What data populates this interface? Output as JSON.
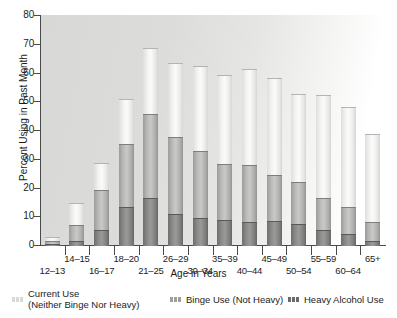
{
  "chart_data": {
    "type": "bar",
    "stacked": true,
    "title": "",
    "xlabel": "Age in Years",
    "ylabel": "Percent Using in Past Month",
    "ylim": [
      0,
      80
    ],
    "yticks": [
      0,
      10,
      20,
      30,
      40,
      50,
      60,
      70,
      80
    ],
    "grid": false,
    "legend_position": "bottom",
    "categories": [
      "12–13",
      "14–15",
      "16–17",
      "18–20",
      "21–25",
      "26–29",
      "30–34",
      "35–39",
      "40–44",
      "45–49",
      "50–54",
      "55–59",
      "60–64",
      "65+"
    ],
    "series": [
      {
        "name": "Heavy Alcohol Use",
        "color": "#7f7f7d",
        "values": [
          0.5,
          1.5,
          5.5,
          13.5,
          16.5,
          11.0,
          9.5,
          9.0,
          8.0,
          8.5,
          7.5,
          5.5,
          4.0,
          1.5
        ]
      },
      {
        "name": "Binge Use (Not Heavy)",
        "color": "#bdbdbb",
        "values": [
          1.0,
          5.5,
          14.0,
          22.0,
          29.5,
          27.0,
          23.5,
          19.5,
          20.0,
          16.0,
          14.5,
          11.0,
          9.0,
          6.5
        ]
      },
      {
        "name": "Current Use (Neither Binge Nor Heavy)",
        "color": "#f0f0ee",
        "values": [
          1.5,
          8.0,
          9.5,
          15.5,
          23.0,
          25.5,
          29.5,
          31.0,
          33.5,
          34.0,
          31.0,
          36.0,
          35.5,
          31.0
        ]
      }
    ],
    "totals": [
      3.0,
      15.0,
      29.0,
      51.0,
      69.0,
      63.5,
      62.5,
      59.5,
      61.5,
      58.5,
      53.0,
      52.5,
      48.5,
      39.0
    ],
    "cumulative_heavy_plus_binge": [
      1.5,
      7.0,
      19.5,
      35.5,
      46.0,
      38.0,
      33.0,
      28.5,
      28.0,
      24.5,
      22.0,
      16.5,
      13.0,
      8.0
    ]
  },
  "axes": {
    "y_title": "Percent Using in Past Month",
    "x_title": "Age in Years",
    "y_tick_labels": [
      "0",
      "10",
      "20",
      "30",
      "40",
      "50",
      "60",
      "70",
      "80"
    ],
    "x_tick_labels": [
      "12–13",
      "14–15",
      "16–17",
      "18–20",
      "21–25",
      "26–29",
      "30–34",
      "35–39",
      "40–44",
      "45–49",
      "50–54",
      "55–59",
      "60–64",
      "65+"
    ]
  },
  "legend": {
    "items": [
      {
        "label_line1": "Current Use",
        "label_line2": "(Neither Binge Nor Heavy)",
        "swatch": "swatch-current"
      },
      {
        "label_line1": "Binge Use (Not Heavy)",
        "label_line2": "",
        "swatch": "swatch-binge"
      },
      {
        "label_line1": "Heavy Alcohol Use",
        "label_line2": "",
        "swatch": "swatch-heavy"
      }
    ]
  }
}
